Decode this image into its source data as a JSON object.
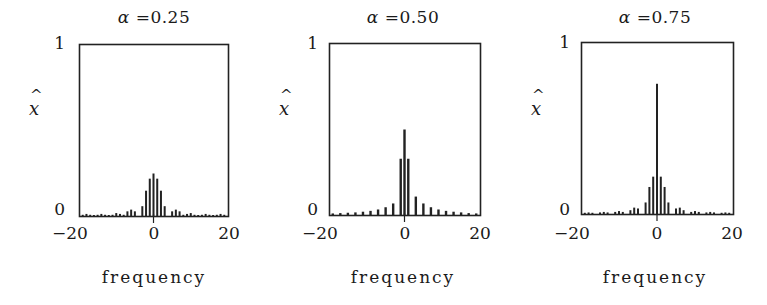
{
  "figure": {
    "ylabel": "x",
    "ylabel_hat": "^",
    "xlabel": "frequency",
    "ytick_top": "1",
    "ytick_bottom": "0",
    "xticks": [
      "−20",
      "0",
      "20"
    ]
  },
  "panels": [
    {
      "alpha_symbol": "α",
      "title_value": "=0.25"
    },
    {
      "alpha_symbol": "α",
      "title_value": "=0.50"
    },
    {
      "alpha_symbol": "α",
      "title_value": "=0.75"
    }
  ],
  "chart_data": [
    {
      "type": "bar",
      "title": "α = 0.25",
      "xlabel": "frequency",
      "ylabel": "x̂",
      "xlim": [
        -20,
        20
      ],
      "ylim": [
        0,
        1
      ],
      "xticks": [
        -20,
        0,
        20
      ],
      "yticks": [
        0,
        1
      ],
      "grid": false,
      "x": [
        -19,
        -18,
        -17,
        -16,
        -15,
        -14,
        -13,
        -12,
        -11,
        -10,
        -9,
        -8,
        -7,
        -6,
        -5,
        -4,
        -3,
        -2,
        -1,
        0,
        1,
        2,
        3,
        4,
        5,
        6,
        7,
        8,
        9,
        10,
        11,
        12,
        13,
        14,
        15,
        16,
        17,
        18,
        19
      ],
      "values": [
        0.01,
        0.015,
        0.01,
        0.005,
        0.01,
        0.015,
        0.01,
        0.005,
        0.01,
        0.02,
        0.015,
        0.01,
        0.03,
        0.04,
        0.03,
        0.0,
        0.06,
        0.15,
        0.22,
        0.25,
        0.22,
        0.15,
        0.06,
        0.0,
        0.03,
        0.04,
        0.03,
        0.01,
        0.015,
        0.02,
        0.01,
        0.005,
        0.01,
        0.015,
        0.01,
        0.005,
        0.01,
        0.015,
        0.01
      ]
    },
    {
      "type": "bar",
      "title": "α = 0.50",
      "xlabel": "frequency",
      "ylabel": "x̂",
      "xlim": [
        -20,
        20
      ],
      "ylim": [
        0,
        1
      ],
      "xticks": [
        -20,
        0,
        20
      ],
      "yticks": [
        0,
        1
      ],
      "grid": false,
      "x": [
        -19,
        -17,
        -15,
        -13,
        -11,
        -9,
        -7,
        -5,
        -3,
        -1,
        0,
        1,
        3,
        5,
        7,
        9,
        11,
        13,
        15,
        17,
        19
      ],
      "values": [
        0.012,
        0.014,
        0.016,
        0.018,
        0.022,
        0.027,
        0.035,
        0.048,
        0.07,
        0.33,
        0.5,
        0.33,
        0.11,
        0.07,
        0.048,
        0.035,
        0.027,
        0.022,
        0.018,
        0.014,
        0.012
      ]
    },
    {
      "type": "bar",
      "title": "α = 0.75",
      "xlabel": "frequency",
      "ylabel": "x̂",
      "xlim": [
        -20,
        20
      ],
      "ylim": [
        0,
        1
      ],
      "xticks": [
        -20,
        0,
        20
      ],
      "yticks": [
        0,
        1
      ],
      "grid": false,
      "x": [
        -19,
        -18,
        -17,
        -16,
        -15,
        -14,
        -13,
        -12,
        -11,
        -10,
        -9,
        -8,
        -7,
        -6,
        -5,
        -4,
        -3,
        -2,
        -1,
        0,
        1,
        2,
        3,
        4,
        5,
        6,
        7,
        8,
        9,
        10,
        11,
        12,
        13,
        14,
        15,
        16,
        17,
        18,
        19
      ],
      "values": [
        0.01,
        0.012,
        0.01,
        0.0,
        0.012,
        0.015,
        0.012,
        0.0,
        0.015,
        0.02,
        0.015,
        0.0,
        0.025,
        0.04,
        0.035,
        0.0,
        0.07,
        0.16,
        0.22,
        0.76,
        0.22,
        0.16,
        0.07,
        0.0,
        0.035,
        0.04,
        0.025,
        0.0,
        0.015,
        0.02,
        0.015,
        0.0,
        0.012,
        0.015,
        0.012,
        0.0,
        0.01,
        0.012,
        0.01
      ]
    }
  ]
}
